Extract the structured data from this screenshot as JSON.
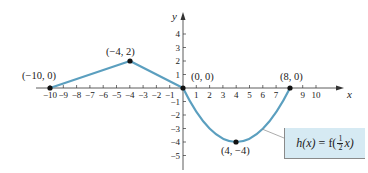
{
  "chart_data": {
    "type": "line",
    "title": "",
    "xlabel": "x",
    "ylabel": "y",
    "xlim": [
      -10.5,
      11
    ],
    "ylim": [
      -5.5,
      4.5
    ],
    "x_ticks": [
      -10,
      -9,
      -8,
      -7,
      -6,
      -5,
      -4,
      -3,
      -2,
      -1,
      1,
      2,
      3,
      4,
      5,
      6,
      7,
      9,
      10
    ],
    "y_ticks": [
      -5,
      -4,
      -3,
      -2,
      -1,
      1,
      2,
      3,
      4
    ],
    "grid": false,
    "series": [
      {
        "name": "h(x) = f(1/2 x)",
        "color": "#5b9fbf",
        "segments": [
          {
            "kind": "line",
            "points": [
              [
                -10,
                0
              ],
              [
                -4,
                2
              ],
              [
                0,
                0
              ]
            ]
          },
          {
            "kind": "parabola",
            "points": [
              [
                0,
                0
              ],
              [
                4,
                -4
              ],
              [
                8,
                0
              ]
            ]
          }
        ]
      }
    ],
    "labeled_points": [
      {
        "label": "(−10, 0)",
        "x": -10,
        "y": 0
      },
      {
        "label": "(−4, 2)",
        "x": -4,
        "y": 2
      },
      {
        "label": "(0, 0)",
        "x": 0,
        "y": 0
      },
      {
        "label": "(8, 0)",
        "x": 8,
        "y": 0
      },
      {
        "label": "(4, −4)",
        "x": 4,
        "y": -4
      }
    ],
    "annotation": "h(x) = f(½x)"
  },
  "labels": {
    "x_axis": "x",
    "y_axis": "y",
    "p1": "(−10, 0)",
    "p2": "(−4, 2)",
    "p3": "(0, 0)",
    "p4": "(8, 0)",
    "p5": "(4, −4)",
    "fn_h": "h(x)",
    "fn_eq": " = f(",
    "fn_num": "1",
    "fn_den": "2",
    "fn_tail": "x)"
  },
  "colors": {
    "curve": "#5b9fbf",
    "box": "#d6eaf3"
  }
}
